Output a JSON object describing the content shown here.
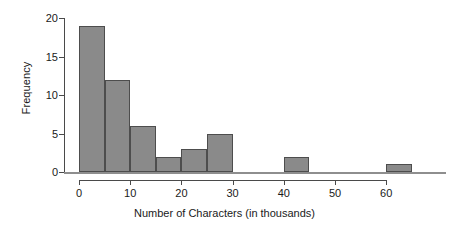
{
  "chart_data": {
    "type": "bar",
    "title": "",
    "subtitle": "",
    "xlabel": "Number of Characters (in thousands)",
    "ylabel": "Frequency",
    "bin_width": 5,
    "bin_edges": [
      0,
      5,
      10,
      15,
      20,
      25,
      30,
      35,
      40,
      45,
      50,
      55,
      60,
      65
    ],
    "categories": [
      "0-5",
      "5-10",
      "10-15",
      "15-20",
      "20-25",
      "25-30",
      "30-35",
      "35-40",
      "40-45",
      "45-50",
      "50-55",
      "55-60",
      "60-65"
    ],
    "values": [
      19,
      12,
      6,
      2,
      3,
      5,
      0,
      0,
      2,
      0,
      0,
      0,
      1
    ],
    "xlim": [
      0,
      65
    ],
    "ylim": [
      0,
      20
    ],
    "xticks": [
      0,
      10,
      20,
      30,
      40,
      50,
      60
    ],
    "xtick_labels": [
      "0",
      "10",
      "20",
      "30",
      "40",
      "50",
      "60"
    ],
    "yticks": [
      0,
      5,
      10,
      15,
      20
    ],
    "ytick_labels": [
      "0",
      "5",
      "10",
      "15",
      "20"
    ],
    "grid": false,
    "legend": false,
    "bar_fill_color": "#8a8a8a",
    "bar_edge_color": "#4d4d4d",
    "axis_color": "#4a4a4a",
    "text_color": "#1a1a1a",
    "background_color": "#ffffff"
  }
}
